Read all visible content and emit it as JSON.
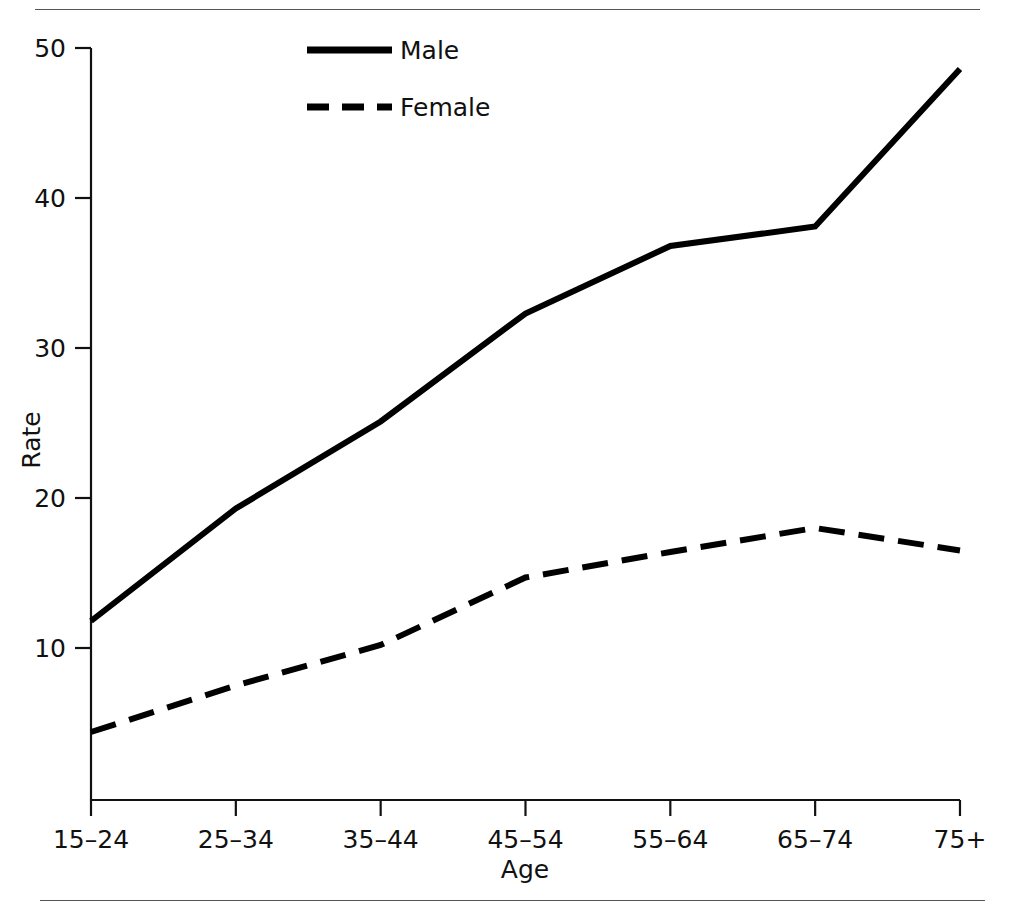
{
  "figure": {
    "top_rule": "horizontal-rule",
    "bottom_rule": "horizontal-rule"
  },
  "chart_data": {
    "type": "line",
    "title": "",
    "subtitle": "",
    "xlabel": "Age",
    "ylabel": "Rate",
    "categories": [
      "15–24",
      "25–34",
      "35–44",
      "45–54",
      "55–64",
      "65–74",
      "75+"
    ],
    "series": [
      {
        "name": "Male",
        "style": "solid",
        "color": "#000000",
        "values": [
          11.8,
          19.3,
          25.1,
          32.3,
          36.8,
          38.1,
          48.6
        ]
      },
      {
        "name": "Female",
        "style": "dashed",
        "color": "#000000",
        "values": [
          4.4,
          7.5,
          10.2,
          14.7,
          16.4,
          18.0,
          16.5
        ]
      }
    ],
    "ylim": [
      0,
      52
    ],
    "yticks": [
      10,
      20,
      30,
      40,
      50
    ],
    "ytick_labels": [
      "10",
      "20",
      "30",
      "40",
      "50"
    ],
    "grid": false,
    "legend_position": "top-center-left",
    "legend_entries": [
      "Male",
      "Female"
    ]
  }
}
